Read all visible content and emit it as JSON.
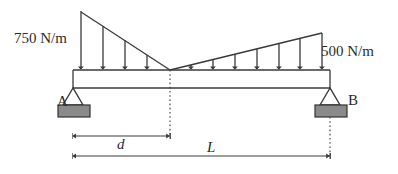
{
  "diagram": {
    "type": "beam-loading-free-body-diagram",
    "labels": {
      "left_load": "750 N/m",
      "right_load": "500 N/m",
      "support_a": "A",
      "support_b": "B",
      "dimension_d": "d",
      "dimension_l": "L"
    },
    "colors": {
      "line": "#3a3a3a",
      "support_fill": "#8a8a8a",
      "support_stroke": "#333333",
      "text": "#2b2b2b",
      "background": "#ffffff"
    },
    "geometry": {
      "beam": {
        "x_start": 73,
        "x_end": 330,
        "y_top": 70,
        "y_bottom": 88
      },
      "left_triangle": {
        "apex_x": 81,
        "apex_y": 12,
        "base_x": 170,
        "base_y": 70,
        "peak_value": 750,
        "units": "N/m"
      },
      "right_triangle": {
        "apex_x": 322,
        "apex_y": 33,
        "base_x": 170,
        "base_y": 70,
        "peak_value": 500,
        "units": "N/m"
      },
      "zero_point_x": 170,
      "support_a_x": 73,
      "support_b_x": 330,
      "dimension_d": {
        "y": 136,
        "x_start": 73,
        "x_end": 170
      },
      "dimension_l": {
        "y": 155,
        "x_start": 73,
        "x_end": 330
      }
    },
    "load_arrows_left_x": [
      81,
      104,
      126,
      148
    ],
    "load_arrows_right_x": [
      191,
      213,
      235,
      257,
      279,
      300,
      322
    ]
  }
}
